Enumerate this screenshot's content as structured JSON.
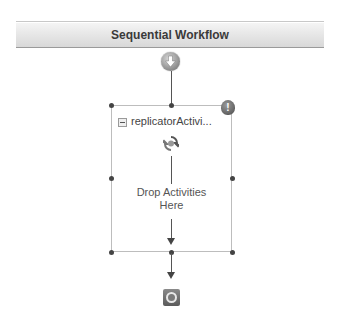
{
  "workflow": {
    "title": "Sequential Workflow",
    "start_icon": "workflow-start-icon",
    "end_icon": "workflow-end-icon"
  },
  "activity": {
    "name": "replicatorActivi...",
    "type_icon": "replicator-icon",
    "collapse_icon": "collapse-icon",
    "warning_badge": "!",
    "drop_text_line1": "Drop Activities",
    "drop_text_line2": "Here"
  }
}
